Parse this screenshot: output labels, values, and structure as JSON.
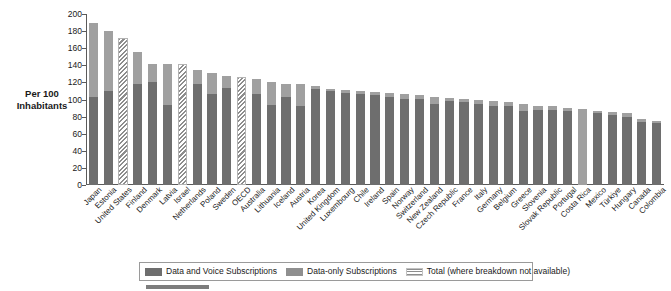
{
  "axis": {
    "y_title": "Per 100 Inhabitants",
    "y_ticks": [
      "200",
      "180",
      "160",
      "140",
      "120",
      "100",
      "80",
      "60",
      "40",
      "20",
      "0"
    ]
  },
  "legend": {
    "items": [
      {
        "key": "voice",
        "label": "Data and Voice Subscriptions"
      },
      {
        "key": "data",
        "label": "Data-only Subscriptions"
      },
      {
        "key": "total",
        "label": "Total (where breakdown not available)"
      }
    ]
  },
  "colors": {
    "voice": "#6e6e6e",
    "data": "#a0a0a0",
    "total_hatch": "#8d8d8d",
    "axis": "#5a5a5a",
    "background": "#ffffff"
  },
  "chart_data": {
    "type": "bar",
    "title": "",
    "xlabel": "",
    "ylabel": "Per 100 Inhabitants",
    "ylim": [
      0,
      200
    ],
    "ytick_step": 20,
    "grid": false,
    "stacked": true,
    "legend_position": "bottom",
    "series": [
      {
        "name": "Data and Voice Subscriptions",
        "key": "voice"
      },
      {
        "name": "Data-only Subscriptions",
        "key": "data"
      },
      {
        "name": "Total (where breakdown not available)",
        "key": "total"
      }
    ],
    "categories": [
      "Japan",
      "Estonia",
      "United States",
      "Finland",
      "Denmark",
      "Latvia",
      "Israel",
      "Netherlands",
      "Poland",
      "Sweden",
      "OECD",
      "Australia",
      "Lithuania",
      "Iceland",
      "Austria",
      "Korea",
      "United Kingdom",
      "Luxembourg",
      "Chile",
      "Ireland",
      "Spain",
      "Norway",
      "Switzerland",
      "New Zealand",
      "Czech Republic",
      "France",
      "Italy",
      "Germany",
      "Belgium",
      "Greece",
      "Slovenia",
      "Slovak Republic",
      "Portugal",
      "Costa Rica",
      "Mexico",
      "Türkiye",
      "Hungary",
      "Canada",
      "Colombia"
    ],
    "points": [
      {
        "category": "Japan",
        "voice": 103,
        "data": 87,
        "total": 190
      },
      {
        "category": "Estonia",
        "voice": 110,
        "data": 70,
        "total": 180
      },
      {
        "category": "United States",
        "voice": null,
        "data": null,
        "total": 172,
        "breakdown_available": false
      },
      {
        "category": "Finland",
        "voice": 118,
        "data": 38,
        "total": 156
      },
      {
        "category": "Denmark",
        "voice": 120,
        "data": 21,
        "total": 141
      },
      {
        "category": "Latvia",
        "voice": 94,
        "data": 47,
        "total": 141
      },
      {
        "category": "Israel",
        "voice": null,
        "data": null,
        "total": 141,
        "breakdown_available": false
      },
      {
        "category": "Netherlands",
        "voice": 118,
        "data": 16,
        "total": 134
      },
      {
        "category": "Poland",
        "voice": 107,
        "data": 24,
        "total": 131
      },
      {
        "category": "Sweden",
        "voice": 113,
        "data": 14,
        "total": 127
      },
      {
        "category": "OECD",
        "voice": null,
        "data": null,
        "total": 126,
        "breakdown_available": false
      },
      {
        "category": "Australia",
        "voice": 106,
        "data": 18,
        "total": 124
      },
      {
        "category": "Lithuania",
        "voice": 94,
        "data": 27,
        "total": 121
      },
      {
        "category": "Iceland",
        "voice": 103,
        "data": 15,
        "total": 118
      },
      {
        "category": "Austria",
        "voice": 93,
        "data": 25,
        "total": 118
      },
      {
        "category": "Korea",
        "voice": 112,
        "data": 4,
        "total": 116
      },
      {
        "category": "United Kingdom",
        "voice": 110,
        "data": 2,
        "total": 112
      },
      {
        "category": "Luxembourg",
        "voice": 108,
        "data": 3,
        "total": 111
      },
      {
        "category": "Chile",
        "voice": 106,
        "data": 4,
        "total": 110
      },
      {
        "category": "Ireland",
        "voice": 105,
        "data": 4,
        "total": 109
      },
      {
        "category": "Spain",
        "voice": 103,
        "data": 5,
        "total": 108
      },
      {
        "category": "Norway",
        "voice": 101,
        "data": 5,
        "total": 106
      },
      {
        "category": "Switzerland",
        "voice": 101,
        "data": 4,
        "total": 105
      },
      {
        "category": "New Zealand",
        "voice": 95,
        "data": 8,
        "total": 103
      },
      {
        "category": "Czech Republic",
        "voice": 98,
        "data": 4,
        "total": 102
      },
      {
        "category": "France",
        "voice": 97,
        "data": 4,
        "total": 101
      },
      {
        "category": "Italy",
        "voice": 95,
        "data": 4,
        "total": 99
      },
      {
        "category": "Germany",
        "voice": 92,
        "data": 6,
        "total": 98
      },
      {
        "category": "Belgium",
        "voice": 92,
        "data": 5,
        "total": 97
      },
      {
        "category": "Greece",
        "voice": 87,
        "data": 8,
        "total": 95
      },
      {
        "category": "Slovenia",
        "voice": 88,
        "data": 5,
        "total": 93
      },
      {
        "category": "Slovak Republic",
        "voice": 88,
        "data": 4,
        "total": 92
      },
      {
        "category": "Portugal",
        "voice": 87,
        "data": 3,
        "total": 90
      },
      {
        "category": "Costa Rica",
        "voice": 0,
        "data": 89,
        "total": 89
      },
      {
        "category": "Mexico",
        "voice": 84,
        "data": 3,
        "total": 87
      },
      {
        "category": "Türkiye",
        "voice": 82,
        "data": 3,
        "total": 85
      },
      {
        "category": "Hungary",
        "voice": 80,
        "data": 4,
        "total": 84
      },
      {
        "category": "Canada",
        "voice": 74,
        "data": 3,
        "total": 77
      },
      {
        "category": "Colombia",
        "voice": 73,
        "data": 2,
        "total": 75
      }
    ]
  }
}
